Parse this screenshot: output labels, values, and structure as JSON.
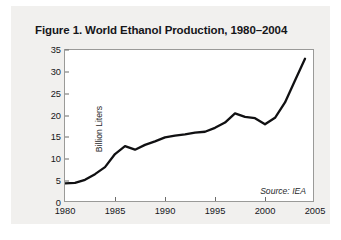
{
  "figure": {
    "title": "Figure 1. World Ethanol Production, 1980–2004",
    "source_note": "Source: IEA",
    "card_background": "#f1f0ee",
    "plot_background": "#ffffff",
    "line_color": "#101012",
    "frame_color": "#9a9a98"
  },
  "chart_data": {
    "type": "line",
    "title": "Figure 1. World Ethanol Production, 1980–2004",
    "subtitle": "",
    "xlabel": "",
    "ylabel": "Billion Liters",
    "xlim": [
      1980,
      2005
    ],
    "ylim": [
      0,
      35
    ],
    "xticks": [
      1980,
      1985,
      1990,
      1995,
      2000,
      2005
    ],
    "yticks": [
      0,
      5,
      10,
      15,
      20,
      25,
      30,
      35
    ],
    "xtick_labels": [
      "1980",
      "1985",
      "1990",
      "1995",
      "2000",
      "2005"
    ],
    "ytick_labels": [
      "0",
      "5",
      "10",
      "15",
      "20",
      "25",
      "30",
      "35"
    ],
    "grid": false,
    "legend": false,
    "legend_position": "none",
    "annotations": [
      "Source: IEA"
    ],
    "x": [
      1980,
      1981,
      1982,
      1983,
      1984,
      1985,
      1986,
      1987,
      1988,
      1989,
      1990,
      1991,
      1992,
      1993,
      1994,
      1995,
      1996,
      1997,
      1998,
      1999,
      2000,
      2001,
      2002,
      2003,
      2004
    ],
    "series": [
      {
        "name": "World Ethanol Production",
        "units": "Billion Liters",
        "values": [
          4.5,
          4.6,
          5.3,
          6.6,
          8.2,
          11.2,
          13.0,
          12.2,
          13.3,
          14.1,
          15.0,
          15.4,
          15.7,
          16.1,
          16.3,
          17.2,
          18.4,
          20.5,
          19.7,
          19.4,
          18.0,
          19.5,
          23.0,
          28.0,
          33.0
        ]
      }
    ]
  }
}
